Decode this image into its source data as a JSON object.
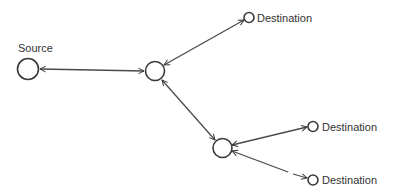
{
  "diagram": {
    "type": "network-graph",
    "colors": {
      "stroke": "#3a3a3a",
      "text": "#333333",
      "background": "#ffffff"
    },
    "nodes": [
      {
        "id": "source",
        "label": "Source",
        "role": "source"
      },
      {
        "id": "router1",
        "label": "",
        "role": "intermediate"
      },
      {
        "id": "router2",
        "label": "",
        "role": "intermediate"
      },
      {
        "id": "dest1",
        "label": "Destination",
        "role": "destination"
      },
      {
        "id": "dest2",
        "label": "Destination",
        "role": "destination"
      },
      {
        "id": "dest3",
        "label": "Destination",
        "role": "destination"
      }
    ],
    "edges": [
      {
        "from": "source",
        "to": "router1",
        "direction": "bidirectional"
      },
      {
        "from": "router1",
        "to": "dest1",
        "direction": "bidirectional"
      },
      {
        "from": "router1",
        "to": "router2",
        "direction": "bidirectional"
      },
      {
        "from": "router2",
        "to": "dest2",
        "direction": "bidirectional"
      },
      {
        "from": "router2",
        "to": "dest3",
        "direction": "bidirectional"
      }
    ],
    "labels": {
      "source": "Source",
      "dest1": "Destination",
      "dest2": "Destination",
      "dest3": "Destination"
    }
  }
}
